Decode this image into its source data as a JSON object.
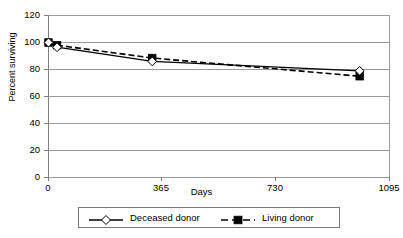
{
  "chart_data": {
    "type": "line",
    "title": "",
    "xlabel": "Days",
    "ylabel": "Percent surviving",
    "xlim": [
      0,
      1200
    ],
    "ylim": [
      0,
      120
    ],
    "x_ticks": [
      0,
      365,
      730,
      1095
    ],
    "x_tick_labels": [
      "0",
      "365",
      "730",
      "1095"
    ],
    "y_ticks": [
      0,
      20,
      40,
      60,
      80,
      100,
      120
    ],
    "y_tick_labels": [
      "0",
      "20",
      "40",
      "60",
      "80",
      "100",
      "120"
    ],
    "grid": "horizontal",
    "legend_position": "below",
    "series": [
      {
        "name": "Deceased donor",
        "marker": "open-diamond",
        "line_style": "solid",
        "color": "#000000",
        "x": [
          0,
          30,
          365,
          1095
        ],
        "values": [
          100,
          96.5,
          86,
          79
        ]
      },
      {
        "name": "Living donor",
        "marker": "filled-square",
        "line_style": "dashed",
        "color": "#000000",
        "x": [
          0,
          30,
          365,
          1095
        ],
        "values": [
          100,
          98,
          88.5,
          75
        ]
      }
    ]
  },
  "axes": {
    "y_title": "Percent surviving",
    "x_title": "Days",
    "y_labels": [
      "120",
      "100",
      "80",
      "60",
      "40",
      "20",
      "0"
    ],
    "x_labels": [
      "0",
      "365",
      "730",
      "1095"
    ]
  },
  "legend": {
    "items": [
      {
        "label": "Deceased donor"
      },
      {
        "label": "Living donor"
      }
    ]
  },
  "colors": {
    "series_line": "#000000",
    "grid": "#9a9a9a",
    "axis": "#808080",
    "background": "#ffffff"
  }
}
